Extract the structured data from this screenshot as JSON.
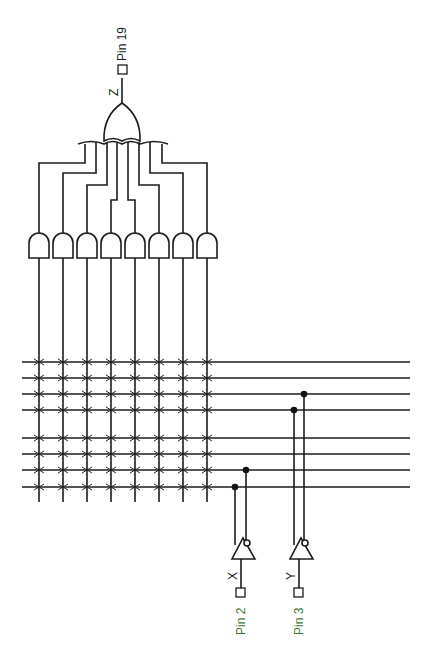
{
  "diagram": {
    "output": {
      "signal": "Z",
      "pin_label": "Pin 19"
    },
    "inputs": [
      {
        "signal": "X",
        "pin_label": "Pin 2"
      },
      {
        "signal": "Y",
        "pin_label": "Pin 3"
      }
    ],
    "and_gate_count": 8,
    "or_gate_count": 1,
    "product_term_x": [
      39,
      63,
      87,
      111,
      135,
      159,
      183,
      207
    ],
    "input_line_y": [
      362,
      378,
      394,
      410,
      438,
      454,
      470,
      487
    ],
    "or_input_x": [
      85,
      96,
      107,
      117,
      128,
      139,
      150,
      162
    ],
    "bend_y": [
      163,
      173,
      185,
      200,
      200,
      185,
      173,
      163
    ],
    "connections": [
      {
        "from": "Y_true",
        "line_index": 3,
        "x": 294
      },
      {
        "from": "Y_inv",
        "line_index": 2,
        "x": 304
      },
      {
        "from": "X_true",
        "line_index": 7,
        "x": 235
      },
      {
        "from": "X_inv",
        "line_index": 6,
        "x": 246
      }
    ],
    "fuse_symbol": "x-cross",
    "colors": {
      "line": "#1c1c1c",
      "pin_label": "#3a7a3a",
      "background": "#ffffff"
    }
  }
}
